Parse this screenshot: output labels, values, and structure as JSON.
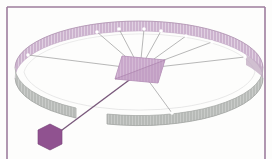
{
  "figure": {
    "title": "3D ring diagram with central hub and satellite node",
    "background_color": "#fdfdfc",
    "frame": {
      "border_color": "#9d7d9d",
      "border_width": 2,
      "inset_left": 6,
      "inset_top": 6,
      "inset_right": 6,
      "label": "figure-frame"
    },
    "ring": {
      "label": "elliptical-ring",
      "center_x": 139,
      "center_y": 68,
      "radius_x": 124,
      "radius_y": 47,
      "band_height": 28,
      "back_color": "#cdb4cf",
      "back_color_dark": "#bda0c0",
      "front_color": "#b9bcb9",
      "front_color_dark": "#a9aca9",
      "edge_color": "#b49ab6",
      "inner_line_color": "#d8d8d8",
      "hatch_color": "#ffffff",
      "back_segment_label": "ring-back-band",
      "front_left_segment_label": "ring-front-left-band",
      "front_right_segment_label": "ring-front-right-band"
    },
    "hub": {
      "label": "central-hub",
      "fill_color": "#c9a8cb",
      "fill_color_dark": "#b692ba",
      "edge_color": "#a87faa",
      "center_x": 140,
      "center_y": 69,
      "width": 44,
      "height": 26
    },
    "node": {
      "label": "satellite-node",
      "shape": "hexagon",
      "fill_color": "#8d4f8d",
      "edge_color": "#6f3a70",
      "center_x": 50,
      "center_y": 137,
      "radius": 13
    },
    "connector": {
      "label": "hub-node-connector",
      "color": "#7a5a7c",
      "width": 1.4
    },
    "spokes": {
      "label": "spoke-lines",
      "color": "#9a9a9a",
      "width": 0.7,
      "count": 9,
      "endpoints": [
        {
          "x": 28,
          "y": 55,
          "marker": true
        },
        {
          "x": 97,
          "y": 32,
          "marker": true
        },
        {
          "x": 119,
          "y": 29,
          "marker": true
        },
        {
          "x": 144,
          "y": 29,
          "marker": true
        },
        {
          "x": 161,
          "y": 31,
          "marker": true
        },
        {
          "x": 186,
          "y": 36,
          "marker": true
        },
        {
          "x": 212,
          "y": 42,
          "marker": true
        },
        {
          "x": 245,
          "y": 57,
          "marker": true
        },
        {
          "x": 172,
          "y": 113,
          "marker": true
        }
      ]
    },
    "markers": {
      "label": "ring-marker-dots",
      "color": "#ffffff",
      "radius": 1.8
    }
  }
}
